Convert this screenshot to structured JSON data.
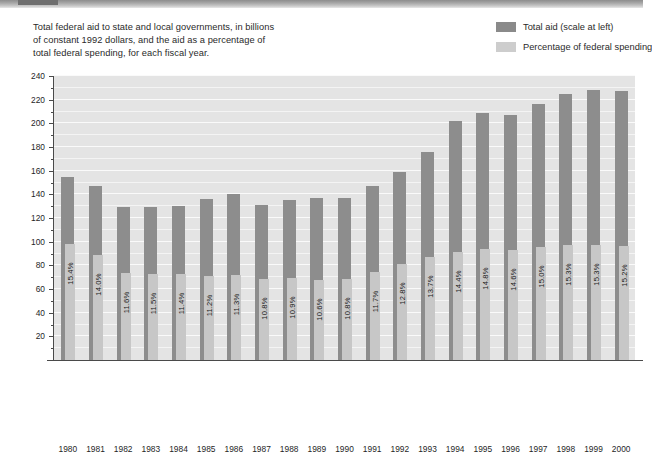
{
  "caption": {
    "line1": "Total federal aid to state and local governments, in billions",
    "line2": "of constant 1992 dollars, and the aid as a percentage of",
    "line3": "total federal spending, for each fiscal year."
  },
  "legend": {
    "items": [
      {
        "label": "Total aid (scale at left)",
        "color": "#8a8a8a",
        "swatch": "dark-swatch"
      },
      {
        "label": "Percentage of federal spending",
        "color": "#cdcdcd",
        "swatch": "light-swatch"
      }
    ]
  },
  "colors": {
    "bar_total_aid": "#8d8d8d",
    "bar_percentage": "#c7c7c7",
    "plot_background": "#e4e4e4",
    "gridline": "#f4f4f4",
    "axis": "#4a4a4a",
    "text": "#1f1f1f"
  },
  "chart_data": {
    "type": "bar",
    "title": "Total federal aid to state and local governments, in billions of constant 1992 dollars, and the aid as a percentage of total federal spending, for each fiscal year.",
    "xlabel": "",
    "ylabel": "",
    "ylim": [
      0,
      240
    ],
    "ytick_step": 20,
    "yminor_step": 10,
    "grid": true,
    "legend_position": "top-right",
    "categories": [
      "1980",
      "1981",
      "1982",
      "1983",
      "1984",
      "1985",
      "1986",
      "1987",
      "1988",
      "1989",
      "1990",
      "1991",
      "1992",
      "1993",
      "1994",
      "1995",
      "1996",
      "1997",
      "1998",
      "1999",
      "2000"
    ],
    "ytick_labels": [
      "240",
      "220",
      "200",
      "180",
      "160",
      "140",
      "120",
      "100",
      "80",
      "60",
      "40",
      "20"
    ],
    "series": [
      {
        "name": "Total aid (scale at left)",
        "unit": "billions of constant 1992 dollars",
        "color": "#8d8d8d",
        "values": [
          155,
          147,
          129,
          129,
          130,
          136,
          140,
          131,
          135,
          137,
          137,
          147,
          159,
          176,
          202,
          209,
          207,
          216,
          225,
          228,
          227
        ]
      },
      {
        "name": "Percentage of federal spending",
        "unit": "percent",
        "color": "#c7c7c7",
        "values": [
          15.4,
          14.0,
          11.6,
          11.5,
          11.4,
          11.2,
          11.3,
          10.8,
          10.9,
          10.6,
          10.8,
          11.7,
          12.8,
          13.7,
          14.4,
          14.8,
          14.6,
          15.0,
          15.3,
          15.3,
          15.2
        ],
        "labels": [
          "15.4%",
          "14.0%",
          "11.6%",
          "11.5%",
          "11.4%",
          "11.2%",
          "11.3%",
          "10.8%",
          "10.9%",
          "10.6%",
          "10.8%",
          "11.7%",
          "12.8%",
          "13.7%",
          "14.4%",
          "14.8%",
          "14.6%",
          "15.0%",
          "15.3%",
          "15.3%",
          "15.2%"
        ]
      }
    ]
  }
}
